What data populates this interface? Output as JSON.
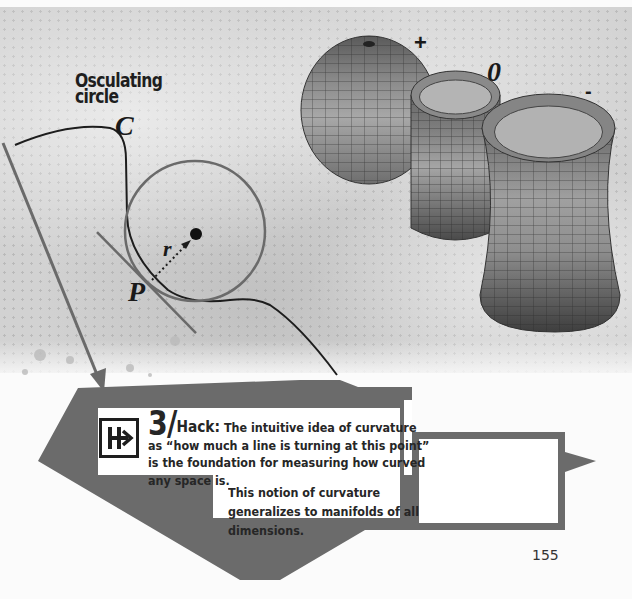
{
  "figure": {
    "title": "Osculating\ncircle",
    "title_line1": "Osculating",
    "title_line2": "circle",
    "labels": {
      "curve": "C",
      "point": "P",
      "radius": "r",
      "positive": "+",
      "zero": "0",
      "negative": "-"
    },
    "surfaces": [
      {
        "name": "sphere",
        "curvature": "+"
      },
      {
        "name": "cylinder",
        "curvature": "0"
      },
      {
        "name": "hyperboloid",
        "curvature": "-"
      }
    ]
  },
  "hack": {
    "icon": "hack-arrow-icon",
    "number": "3/",
    "label": "Hack:",
    "text": "The intuitive idea of curvature as “how much a line is turning at this point” is the foundation for measuring how curved any space is.",
    "text2": "This notion of curvature generalizes to manifolds of all dimensions."
  },
  "colors": {
    "banner_gray": "#6b6b6b",
    "text_dark": "#262626",
    "background_texture": "#d2d2d2"
  },
  "page_number": "155"
}
